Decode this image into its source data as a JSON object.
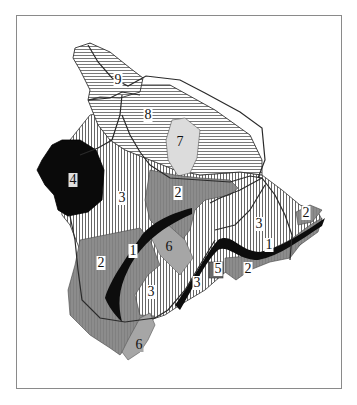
{
  "map": {
    "subject": "Island of Hawaii lava-flow hazard zones",
    "legend_style": "zone numbers printed on map",
    "colors": {
      "zone_1": "#0d0d0d",
      "zone_2": "#8c8c8c",
      "zone_3_stripes": "#555555",
      "zone_4": "#0a0a0a",
      "zone_5": "#6a6a6a",
      "zone_6": "#a6a6a6",
      "zone_7": "#dcdcdc",
      "zone_8_stripes": "#6a6a6a",
      "zone_9_stripes": "#6a6a6a",
      "roads": "#2a2a2a",
      "frame": "#8a8a8a"
    },
    "labels": [
      {
        "id": "z9",
        "text": "9",
        "x": 118,
        "y": 80
      },
      {
        "id": "z8",
        "text": "8",
        "x": 148,
        "y": 115
      },
      {
        "id": "z7",
        "text": "7",
        "x": 180,
        "y": 142
      },
      {
        "id": "z4",
        "text": "4",
        "x": 73,
        "y": 180
      },
      {
        "id": "z3a",
        "text": "3",
        "x": 122,
        "y": 198
      },
      {
        "id": "z2a",
        "text": "2",
        "x": 178,
        "y": 193
      },
      {
        "id": "z2b",
        "text": "2",
        "x": 306,
        "y": 213
      },
      {
        "id": "z3b",
        "text": "3",
        "x": 259,
        "y": 224
      },
      {
        "id": "z1a",
        "text": "1",
        "x": 269,
        "y": 245
      },
      {
        "id": "z6a",
        "text": "6",
        "x": 169,
        "y": 247
      },
      {
        "id": "z1b",
        "text": "1",
        "x": 133,
        "y": 251
      },
      {
        "id": "z2c",
        "text": "2",
        "x": 101,
        "y": 263
      },
      {
        "id": "z5",
        "text": "5",
        "x": 218,
        "y": 269
      },
      {
        "id": "z2d",
        "text": "2",
        "x": 248,
        "y": 269
      },
      {
        "id": "z3c",
        "text": "3",
        "x": 197,
        "y": 283
      },
      {
        "id": "z3d",
        "text": "3",
        "x": 151,
        "y": 292
      },
      {
        "id": "z6b",
        "text": "6",
        "x": 139,
        "y": 345
      }
    ]
  }
}
